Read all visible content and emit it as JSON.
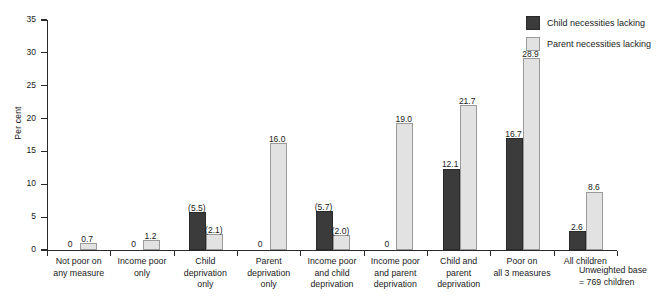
{
  "chart_data": {
    "type": "bar",
    "title": "",
    "xlabel": "",
    "ylabel": "Per cent",
    "ylim": [
      0,
      35
    ],
    "yticks": [
      0,
      5,
      10,
      15,
      20,
      25,
      30,
      35
    ],
    "ytick_labels": [
      "0",
      "5",
      "10",
      "15",
      "20",
      "25",
      "30",
      "35"
    ],
    "grid": false,
    "legend_position": "top-right",
    "categories": [
      "Not poor on any measure",
      "Income poor only",
      "Child deprivation only",
      "Parent deprivation only",
      "Income poor and child deprivation",
      "Income poor and parent deprivation",
      "Child and parent deprivation",
      "Poor on all 3 measures",
      "All children"
    ],
    "category_lines": [
      [
        "Not poor on",
        "any measure"
      ],
      [
        "Income poor",
        "only"
      ],
      [
        "Child",
        "deprivation",
        "only"
      ],
      [
        "Parent",
        "deprivation",
        "only"
      ],
      [
        "Income poor",
        "and child",
        "deprivation"
      ],
      [
        "Income poor",
        "and parent",
        "deprivation"
      ],
      [
        "Child and",
        "parent",
        "deprivation"
      ],
      [
        "Poor on",
        "all 3 measures"
      ],
      [
        "All children"
      ]
    ],
    "series": [
      {
        "name": "Child necessities lacking",
        "color": "#3b3b3b",
        "values": [
          0,
          0,
          5.5,
          0,
          5.7,
          0,
          12.1,
          16.7,
          2.6
        ],
        "labels": [
          "0",
          "0",
          "(5.5)",
          "0",
          "(5.7)",
          "0",
          "12.1",
          "16.7",
          "2.6"
        ]
      },
      {
        "name": "Parent necessities lacking",
        "color": "#e2e2e2",
        "values": [
          0.7,
          1.2,
          2.1,
          16.0,
          2.0,
          19.0,
          21.7,
          28.9,
          8.6
        ],
        "labels": [
          "0.7",
          "1.2",
          "(2.1)",
          "16.0",
          "(2.0)",
          "19.0",
          "21.7",
          "28.9",
          "8.6"
        ]
      }
    ],
    "annotations": [
      "Unweighted base",
      "= 769 children"
    ]
  },
  "legend": {
    "items": [
      {
        "label": "Child necessities lacking",
        "color": "#3b3b3b"
      },
      {
        "label": "Parent necessities lacking",
        "color": "#e2e2e2"
      }
    ]
  },
  "footnote": {
    "line1": "Unweighted base",
    "line2": "= 769 children"
  }
}
